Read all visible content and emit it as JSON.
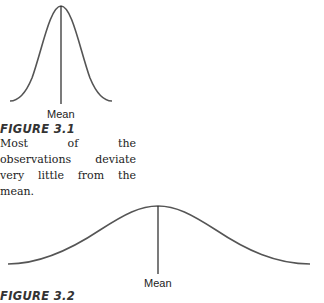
{
  "figures": [
    {
      "title": "FIGURE 3.1",
      "mean_label": "Mean",
      "caption": "Most of the observations deviate very little from the mean."
    },
    {
      "title": "FIGURE 3.2",
      "mean_label": "Mean"
    }
  ],
  "colors": {
    "curve": "#555555",
    "line": "#222222",
    "text": "#222222"
  }
}
